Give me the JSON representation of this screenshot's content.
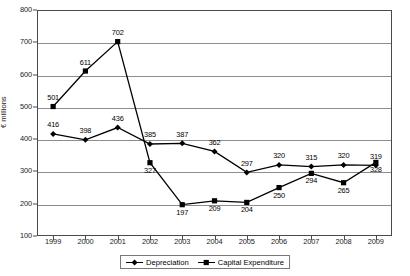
{
  "chart_data": {
    "type": "line",
    "title": "",
    "xlabel": "",
    "ylabel": "€ millions",
    "categories": [
      "1999",
      "2000",
      "2001",
      "2002",
      "2003",
      "2004",
      "2005",
      "2006",
      "2007",
      "2008",
      "2009"
    ],
    "ylim": [
      100,
      800
    ],
    "yticks": [
      100,
      200,
      300,
      400,
      500,
      600,
      700,
      800
    ],
    "grid": true,
    "legend_position": "bottom-center",
    "series": [
      {
        "name": "Depreciation",
        "marker": "diamond",
        "values": [
          416,
          398,
          436,
          385,
          387,
          362,
          297,
          320,
          315,
          320,
          319
        ],
        "label_offsets": [
          "above",
          "above",
          "above",
          "above",
          "above",
          "above",
          "above",
          "above",
          "above",
          "above",
          "above"
        ]
      },
      {
        "name": "Capital Expenditure",
        "marker": "square",
        "values": [
          501,
          611,
          702,
          327,
          197,
          209,
          204,
          250,
          294,
          265,
          328
        ],
        "label_offsets": [
          "above",
          "above",
          "above",
          "below",
          "below",
          "below",
          "below",
          "below",
          "below",
          "below",
          "below"
        ]
      }
    ]
  },
  "legend": {
    "items": [
      {
        "label": "Depreciation",
        "marker": "diamond"
      },
      {
        "label": "Capital Expenditure",
        "marker": "square"
      }
    ]
  }
}
